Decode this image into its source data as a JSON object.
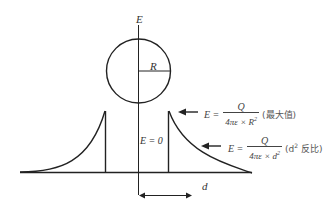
{
  "diagram": {
    "type": "electric field of a charged conducting sphere vs distance",
    "axis_label_vertical": "E",
    "axis_label_horizontal": "d",
    "radius_label": "R",
    "inside_label": "E = 0",
    "formulas": [
      {
        "lhs": "E =",
        "numerator": "Q",
        "denominator": "4πε × R",
        "denominator_exp": "2",
        "note": "(最大值)"
      },
      {
        "lhs": "E =",
        "numerator": "Q",
        "denominator": "4πε × d",
        "denominator_exp": "2",
        "note_prefix": "(d",
        "note_exp": "2",
        "note_suffix": " 反比)"
      }
    ],
    "colors": {
      "stroke": "#222222",
      "text": "#444444",
      "background": "#ffffff"
    }
  }
}
